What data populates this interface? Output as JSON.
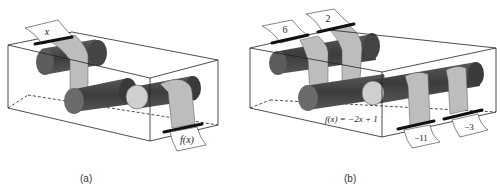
{
  "panels": [
    {
      "id": "a",
      "caption": "(a)",
      "input_label": "x",
      "output_label": "f(x)"
    },
    {
      "id": "b",
      "caption": "(b)",
      "inputs": [
        "6",
        "2"
      ],
      "outputs": [
        "−11",
        "−3"
      ],
      "function_label": "f(x) = −2x + 1"
    }
  ],
  "colors": {
    "roller_dark": "#4a4a4a",
    "roller_end": "#7a7a7a",
    "roller_light": "#cfcfcf",
    "paper_strip": "#bdbdbd",
    "box_line": "#222222",
    "clip": "#111111"
  }
}
